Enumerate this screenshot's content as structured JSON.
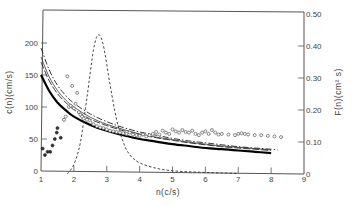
{
  "chart_data": {
    "type": "line",
    "title": "",
    "xlabel": "n(c/s)",
    "ylabel": "c(n)(cm/s)",
    "ylabel_right": "F(n)(cm² s)",
    "xlim": [
      1,
      9
    ],
    "ylim": [
      0,
      230
    ],
    "ylim_right": [
      0,
      0.5
    ],
    "grid": false,
    "legend": "none",
    "x_ticks": [
      "1",
      "2",
      "3",
      "4",
      "5",
      "6",
      "7",
      "8",
      "9"
    ],
    "y_ticks": [
      "0",
      "50",
      "100",
      "150",
      "200"
    ],
    "y_ticks_right": [
      "0",
      "0.10",
      "0.20",
      "0.30",
      "0.40",
      "0.50"
    ],
    "series": [
      {
        "name": "phase speed model (thick solid)",
        "style": "solid-thick",
        "axis": "left",
        "x": [
          1.0,
          1.25,
          1.5,
          1.75,
          2.0,
          2.5,
          3.0,
          3.5,
          4.0,
          4.5,
          5.0,
          5.5,
          6.0,
          6.5,
          7.0,
          7.5,
          8.0
        ],
        "y": [
          150,
          125,
          107,
          95,
          85,
          72,
          63,
          56,
          50,
          46,
          42,
          39,
          36,
          34,
          32,
          30,
          28
        ]
      },
      {
        "name": "phase speed model (long dash)",
        "style": "long-dash",
        "axis": "left",
        "x": [
          1.0,
          1.25,
          1.5,
          1.75,
          2.0,
          2.5,
          3.0,
          3.5,
          4.0,
          4.5,
          5.0,
          5.5,
          6.0,
          6.5,
          7.0,
          7.5,
          8.0
        ],
        "y": [
          170,
          141,
          121,
          107,
          96,
          81,
          71,
          63,
          57,
          52,
          48,
          44,
          41,
          38,
          36,
          34,
          32
        ]
      },
      {
        "name": "phase speed model (dash-dot)",
        "style": "dash-dot",
        "axis": "left",
        "x": [
          1.0,
          1.25,
          1.5,
          1.75,
          2.0,
          2.5,
          3.0,
          3.5,
          4.0,
          4.5,
          5.0,
          5.5,
          6.0,
          6.5,
          7.0,
          7.5,
          8.0,
          8.2
        ],
        "y": [
          192,
          158,
          134,
          118,
          106,
          89,
          77,
          68,
          61,
          56,
          51,
          47,
          44,
          41,
          38,
          36,
          34,
          33
        ]
      },
      {
        "name": "phase speed model (thin solid)",
        "style": "thin",
        "axis": "left",
        "x": [
          1.0,
          1.25,
          1.5,
          1.75,
          2.0,
          2.5,
          3.0,
          3.5,
          4.0,
          4.5,
          5.0,
          5.5,
          6.0,
          6.5,
          7.0,
          7.5,
          8.0
        ],
        "y": [
          178,
          147,
          126,
          111,
          100,
          84,
          73,
          65,
          58,
          53,
          49,
          45,
          42,
          39,
          37,
          35,
          33
        ]
      },
      {
        "name": "F(n) spectrum",
        "style": "short-dash",
        "axis": "right",
        "x": [
          1.8,
          2.0,
          2.2,
          2.4,
          2.6,
          2.75,
          2.9,
          3.1,
          3.3,
          3.5,
          3.7,
          4.0,
          4.5,
          5.0,
          5.5,
          6.0,
          6.5,
          7.0
        ],
        "y": [
          0.0,
          0.03,
          0.1,
          0.24,
          0.39,
          0.435,
          0.4,
          0.28,
          0.17,
          0.1,
          0.06,
          0.035,
          0.018,
          0.01,
          0.007,
          0.005,
          0.003,
          0.002
        ]
      },
      {
        "name": "measured c(n) (open circles)",
        "style": "open-circle",
        "axis": "left",
        "x": [
          1.7,
          1.75,
          1.8,
          1.85,
          1.9,
          1.95,
          2.0,
          2.05,
          2.1,
          2.15,
          2.2,
          2.25,
          2.3,
          2.4,
          2.5,
          2.6,
          2.7,
          2.8,
          2.9,
          3.0,
          3.1,
          3.2,
          3.3,
          3.4,
          3.5,
          3.6,
          3.7,
          3.8,
          3.9,
          4.0,
          4.1,
          4.2,
          4.3,
          4.4,
          4.5,
          4.6,
          4.7,
          4.8,
          4.9,
          5.0,
          5.1,
          5.2,
          5.3,
          5.4,
          5.5,
          5.6,
          5.7,
          5.8,
          5.9,
          6.0,
          6.1,
          6.2,
          6.3,
          6.4,
          6.5,
          6.7,
          6.9,
          7.0,
          7.1,
          7.2,
          7.3,
          7.5,
          7.7,
          7.9,
          8.1,
          8.3
        ],
        "y": [
          80,
          85,
          148,
          100,
          102,
          133,
          98,
          105,
          122,
          92,
          88,
          85,
          82,
          80,
          76,
          73,
          70,
          68,
          67,
          65,
          63,
          62,
          61,
          60,
          59,
          58,
          60,
          57,
          56,
          55,
          57,
          54,
          56,
          58,
          61,
          57,
          63,
          60,
          58,
          65,
          62,
          60,
          64,
          61,
          60,
          63,
          58,
          56,
          60,
          62,
          58,
          64,
          60,
          57,
          58,
          57,
          56,
          58,
          59,
          58,
          57,
          56,
          56,
          55,
          54,
          53
        ]
      },
      {
        "name": "measured c(n) (filled circles)",
        "style": "filled-circle",
        "axis": "left",
        "x": [
          1.05,
          1.12,
          1.2,
          1.28,
          1.35,
          1.42,
          1.48,
          1.5,
          1.6
        ],
        "y": [
          35,
          25,
          30,
          30,
          40,
          50,
          60,
          67,
          52
        ]
      }
    ]
  }
}
